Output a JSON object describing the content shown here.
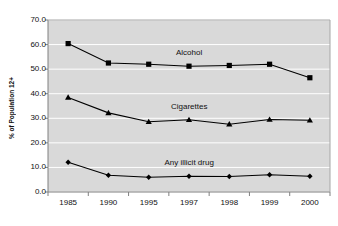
{
  "chart_data": {
    "type": "line",
    "title": "",
    "xlabel": "",
    "ylabel": "% of Population 12+",
    "categories": [
      "1985",
      "1990",
      "1995",
      "1997",
      "1998",
      "1999",
      "2000"
    ],
    "ylim": [
      0.0,
      70.0
    ],
    "ytick_step": 10.0,
    "ytick_labels": [
      "70.0",
      "60.0",
      "50.0",
      "40.0",
      "30.0",
      "20.0",
      "10.0",
      "0.0"
    ],
    "grid": true,
    "legend_position": "inline-annotation",
    "plot_background": "#d9d9d9",
    "series": [
      {
        "name": "Alcohol",
        "marker": "square",
        "color": "#000000",
        "label_x_category": "1997",
        "values": [
          60.4,
          52.5,
          52.0,
          51.2,
          51.5,
          52.0,
          46.5
        ]
      },
      {
        "name": "Cigarettes",
        "marker": "triangle",
        "color": "#000000",
        "label_x_category": "1997",
        "values": [
          38.5,
          32.2,
          28.6,
          29.4,
          27.6,
          29.5,
          29.2
        ]
      },
      {
        "name": "Any illicit drug",
        "marker": "diamond",
        "color": "#000000",
        "label_x_category": "1997",
        "values": [
          12.1,
          6.8,
          6.0,
          6.4,
          6.3,
          7.0,
          6.4
        ]
      }
    ]
  },
  "header": {
    "truncated_title": ""
  },
  "axes": {
    "y_title": "% of Population 12+"
  },
  "annotations": {
    "alcohol": "Alcohol",
    "cigarettes": "Cigarettes",
    "illicit": "Any illicit drug"
  }
}
